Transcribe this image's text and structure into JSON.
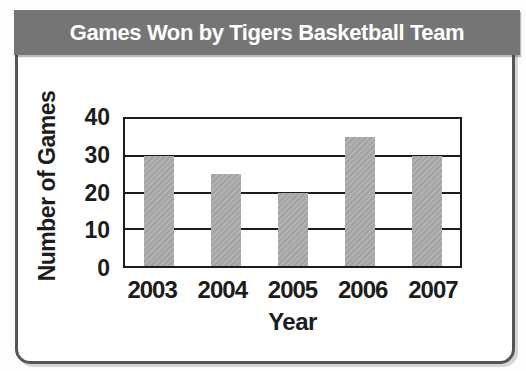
{
  "banner": {
    "title": "Games Won by Tigers Basketball Team"
  },
  "colors": {
    "banner_gray": "#757575",
    "bar_gray": "#a9a9a9",
    "axis_black": "#1c1c1c"
  },
  "chart_data": {
    "type": "bar",
    "title": "Games Won by Tigers Basketball Team",
    "categories": [
      "2003",
      "2004",
      "2005",
      "2006",
      "2007"
    ],
    "values": [
      30,
      25,
      20,
      35,
      30
    ],
    "xlabel": "Year",
    "ylabel": "Number of Games",
    "ylim": [
      0,
      40
    ],
    "yticks": [
      0,
      10,
      20,
      30,
      40
    ],
    "grid": "horizontal",
    "legend": "none"
  }
}
